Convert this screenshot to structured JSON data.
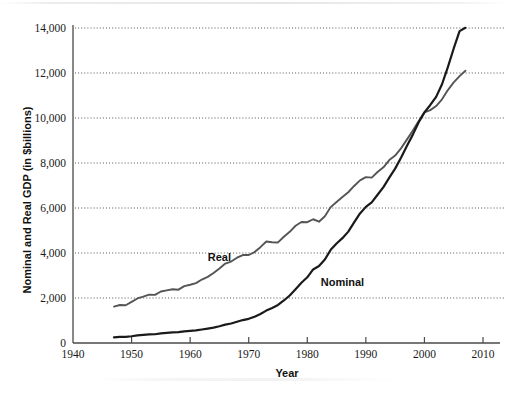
{
  "chart_data": {
    "type": "line",
    "title": "",
    "xlabel": "Year",
    "ylabel": "Nominal and Real GDP (in $billions)",
    "xlim": [
      1940,
      2010
    ],
    "ylim": [
      0,
      14000
    ],
    "xticks": [
      "1940",
      "1950",
      "1960",
      "1970",
      "1980",
      "1990",
      "2000",
      "2010"
    ],
    "yticks": [
      "0",
      "2,000",
      "4,000",
      "6,000",
      "8,000",
      "10,000",
      "12,000",
      "14,000"
    ],
    "grid": "horizontal-dotted",
    "legend": "inline-labels",
    "series": [
      {
        "name": "Real",
        "color": "#555555",
        "label_x": 1965,
        "label_y": 3650,
        "x": [
          1947,
          1948,
          1949,
          1950,
          1951,
          1952,
          1953,
          1954,
          1955,
          1956,
          1957,
          1958,
          1959,
          1960,
          1961,
          1962,
          1963,
          1964,
          1965,
          1966,
          1967,
          1968,
          1969,
          1970,
          1971,
          1972,
          1973,
          1974,
          1975,
          1976,
          1977,
          1978,
          1979,
          1980,
          1981,
          1982,
          1983,
          1984,
          1985,
          1986,
          1987,
          1988,
          1989,
          1990,
          1991,
          1992,
          1993,
          1994,
          1995,
          1996,
          1997,
          1998,
          1999,
          2000,
          2001,
          2002,
          2003,
          2004,
          2005,
          2006,
          2007
        ],
        "values": [
          1620,
          1690,
          1680,
          1830,
          1980,
          2060,
          2150,
          2140,
          2290,
          2340,
          2390,
          2370,
          2530,
          2590,
          2660,
          2820,
          2940,
          3110,
          3310,
          3530,
          3620,
          3790,
          3910,
          3910,
          4040,
          4260,
          4510,
          4480,
          4470,
          4720,
          4940,
          5210,
          5380,
          5370,
          5500,
          5390,
          5630,
          6040,
          6270,
          6490,
          6700,
          6980,
          7230,
          7370,
          7350,
          7600,
          7810,
          8130,
          8330,
          8650,
          9040,
          9430,
          9850,
          10250,
          10350,
          10530,
          10830,
          11240,
          11580,
          11860,
          12100
        ]
      },
      {
        "name": "Nominal",
        "color": "#1a1a1a",
        "label_x": 1986,
        "label_y": 2520,
        "x": [
          1947,
          1948,
          1949,
          1950,
          1951,
          1952,
          1953,
          1954,
          1955,
          1956,
          1957,
          1958,
          1959,
          1960,
          1961,
          1962,
          1963,
          1964,
          1965,
          1966,
          1967,
          1968,
          1969,
          1970,
          1971,
          1972,
          1973,
          1974,
          1975,
          1976,
          1977,
          1978,
          1979,
          1980,
          1981,
          1982,
          1983,
          1984,
          1985,
          1986,
          1987,
          1988,
          1989,
          1990,
          1991,
          1992,
          1993,
          1994,
          1995,
          1996,
          1997,
          1998,
          1999,
          2000,
          2001,
          2002,
          2003,
          2004,
          2005,
          2006,
          2007
        ],
        "values": [
          250,
          275,
          270,
          300,
          340,
          360,
          385,
          390,
          425,
          450,
          475,
          480,
          520,
          540,
          560,
          600,
          640,
          685,
          745,
          815,
          865,
          945,
          1020,
          1075,
          1170,
          1290,
          1440,
          1560,
          1690,
          1890,
          2110,
          2390,
          2680,
          2920,
          3270,
          3420,
          3710,
          4140,
          4420,
          4660,
          4950,
          5360,
          5760,
          6050,
          6250,
          6590,
          6930,
          7350,
          7750,
          8230,
          8760,
          9250,
          9800,
          10250,
          10580,
          10940,
          11500,
          12260,
          13090,
          13860,
          14010
        ]
      }
    ]
  },
  "axes": {
    "y_title": "Nominal and Real GDP (in $billions)",
    "x_title": "Year"
  }
}
